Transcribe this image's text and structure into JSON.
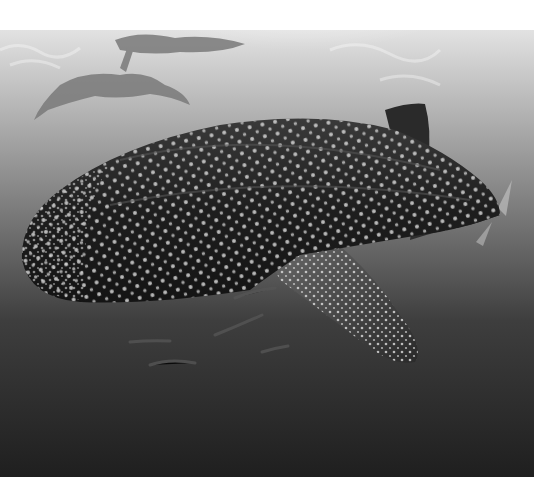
{
  "image": {
    "subject": "whale shark swimming underwater with snorkelers at the surface",
    "style": "black-and-white photograph",
    "colors": {
      "margin": "#ffffff",
      "surface_light": "#e6e6e6",
      "mid_water": "#8a8a8a",
      "deep_water": "#262626",
      "shark_body": "#1c1c1c",
      "spots": "#d8d8d8"
    }
  }
}
